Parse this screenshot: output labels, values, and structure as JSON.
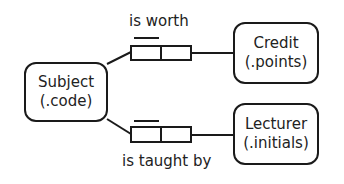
{
  "diagram": {
    "entities": [
      {
        "id": "subject",
        "name": "Subject",
        "key": "(.code)"
      },
      {
        "id": "credit",
        "name": "Credit",
        "key": "(.points)"
      },
      {
        "id": "lecturer",
        "name": "Lecturer",
        "key": "(.initials)"
      }
    ],
    "relationships": [
      {
        "from": "subject",
        "to": "credit",
        "label": "is worth"
      },
      {
        "from": "subject",
        "to": "lecturer",
        "label": "is taught by"
      }
    ]
  }
}
